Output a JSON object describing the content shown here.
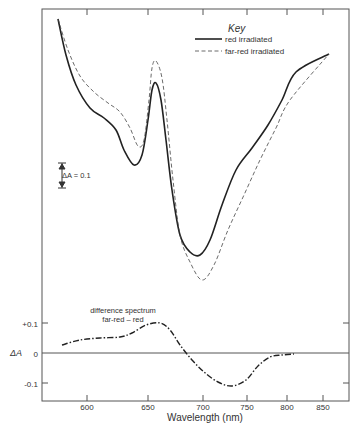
{
  "chart_data": {
    "type": "line",
    "title": "",
    "xlabel": "Wavelength (nm)",
    "ylabel": "ΔA",
    "x_ticks": [
      600,
      650,
      700,
      750,
      800,
      850
    ],
    "x_tick_px": [
      87,
      148,
      203,
      247,
      287,
      323
    ],
    "y_ticks_difference": [
      "+0.1",
      "0",
      "-0.1"
    ],
    "scale_bar_label": "ΔA = 0.1",
    "legend": {
      "title": "Key",
      "entries": [
        {
          "name": "red irradiated",
          "style": "solid"
        },
        {
          "name": "far-red irradiated",
          "style": "dashed"
        }
      ]
    },
    "annotation": {
      "line1": "difference spectrum",
      "line2": "far-red – red"
    },
    "series": [
      {
        "name": "red irradiated",
        "style": "solid",
        "points_px": [
          [
            58,
            19
          ],
          [
            66,
            55
          ],
          [
            76,
            85
          ],
          [
            90,
            108
          ],
          [
            104,
            118
          ],
          [
            116,
            130
          ],
          [
            124,
            150
          ],
          [
            134,
            165
          ],
          [
            142,
            155
          ],
          [
            148,
            120
          ],
          [
            152,
            90
          ],
          [
            156,
            83
          ],
          [
            161,
            100
          ],
          [
            166,
            140
          ],
          [
            172,
            190
          ],
          [
            180,
            235
          ],
          [
            190,
            252
          ],
          [
            200,
            255
          ],
          [
            210,
            240
          ],
          [
            222,
            205
          ],
          [
            236,
            170
          ],
          [
            252,
            148
          ],
          [
            268,
            125
          ],
          [
            282,
            100
          ],
          [
            296,
            72
          ],
          [
            329,
            54
          ]
        ]
      },
      {
        "name": "far-red irradiated",
        "style": "dashed",
        "points_px": [
          [
            58,
            19
          ],
          [
            68,
            50
          ],
          [
            80,
            76
          ],
          [
            94,
            92
          ],
          [
            108,
            103
          ],
          [
            120,
            112
          ],
          [
            130,
            128
          ],
          [
            138,
            146
          ],
          [
            144,
            140
          ],
          [
            149,
            100
          ],
          [
            152,
            68
          ],
          [
            156,
            61
          ],
          [
            162,
            78
          ],
          [
            167,
            120
          ],
          [
            173,
            180
          ],
          [
            180,
            235
          ],
          [
            190,
            262
          ],
          [
            202,
            280
          ],
          [
            214,
            265
          ],
          [
            228,
            230
          ],
          [
            244,
            195
          ],
          [
            260,
            160
          ],
          [
            276,
            128
          ],
          [
            290,
            100
          ],
          [
            329,
            54
          ]
        ]
      },
      {
        "name": "difference spectrum far-red - red",
        "style": "dash-dot",
        "points_px": [
          [
            62,
            345
          ],
          [
            80,
            340
          ],
          [
            100,
            338
          ],
          [
            120,
            337
          ],
          [
            132,
            333
          ],
          [
            146,
            325
          ],
          [
            160,
            323
          ],
          [
            170,
            330
          ],
          [
            180,
            345
          ],
          [
            192,
            360
          ],
          [
            204,
            372
          ],
          [
            218,
            382
          ],
          [
            232,
            386
          ],
          [
            246,
            380
          ],
          [
            258,
            366
          ],
          [
            270,
            357
          ],
          [
            282,
            355
          ],
          [
            294,
            354
          ]
        ]
      }
    ]
  }
}
